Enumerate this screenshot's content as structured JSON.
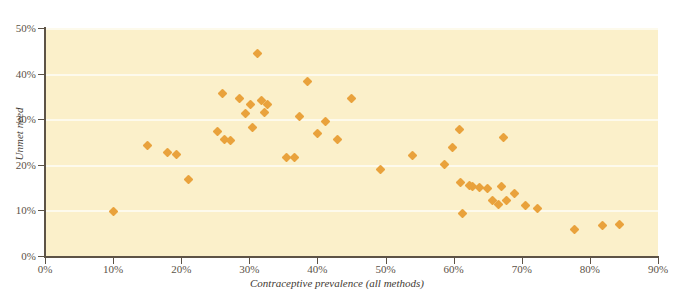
{
  "chart_data": {
    "type": "scatter",
    "title": "",
    "xlabel": "Contraceptive prevalence (all methods)",
    "ylabel": "Unmet need",
    "xlim": [
      0,
      90
    ],
    "ylim": [
      0,
      50
    ],
    "xticks": [
      "0%",
      "10%",
      "20%",
      "30%",
      "40%",
      "50%",
      "60%",
      "70%",
      "80%",
      "90%"
    ],
    "xtick_values": [
      0,
      10,
      20,
      30,
      40,
      50,
      60,
      70,
      80,
      90
    ],
    "yticks": [
      "0%",
      "10%",
      "20%",
      "30%",
      "40%",
      "50%"
    ],
    "ytick_values": [
      0,
      10,
      20,
      30,
      40,
      50
    ],
    "grid": "horizontal",
    "legend": "none",
    "marker": "diamond",
    "marker_color": "#e9a23c",
    "plot_background": "#fbf0ca",
    "gridline_color": "#fdfaec",
    "axis_color": "#5d5346",
    "points": [
      {
        "x": 10.0,
        "y": 9.8
      },
      {
        "x": 15.0,
        "y": 24.3
      },
      {
        "x": 18.0,
        "y": 22.8
      },
      {
        "x": 19.3,
        "y": 22.2
      },
      {
        "x": 21.0,
        "y": 16.7
      },
      {
        "x": 25.3,
        "y": 27.2
      },
      {
        "x": 26.0,
        "y": 35.6
      },
      {
        "x": 26.3,
        "y": 25.5
      },
      {
        "x": 27.2,
        "y": 25.4
      },
      {
        "x": 28.6,
        "y": 34.6
      },
      {
        "x": 29.5,
        "y": 31.3
      },
      {
        "x": 30.2,
        "y": 33.2
      },
      {
        "x": 30.5,
        "y": 28.2
      },
      {
        "x": 31.2,
        "y": 44.5
      },
      {
        "x": 31.8,
        "y": 34.2
      },
      {
        "x": 32.3,
        "y": 31.5
      },
      {
        "x": 32.6,
        "y": 33.3
      },
      {
        "x": 35.5,
        "y": 21.6
      },
      {
        "x": 36.6,
        "y": 21.7
      },
      {
        "x": 37.3,
        "y": 30.6
      },
      {
        "x": 38.5,
        "y": 38.3
      },
      {
        "x": 40.0,
        "y": 26.9
      },
      {
        "x": 41.2,
        "y": 29.6
      },
      {
        "x": 43.0,
        "y": 25.5
      },
      {
        "x": 45.0,
        "y": 34.5
      },
      {
        "x": 49.3,
        "y": 18.9
      },
      {
        "x": 54.0,
        "y": 22.1
      },
      {
        "x": 58.6,
        "y": 20.0
      },
      {
        "x": 59.8,
        "y": 23.8
      },
      {
        "x": 60.8,
        "y": 27.8
      },
      {
        "x": 61.0,
        "y": 16.2
      },
      {
        "x": 61.3,
        "y": 9.3
      },
      {
        "x": 62.3,
        "y": 15.5
      },
      {
        "x": 62.8,
        "y": 15.3
      },
      {
        "x": 63.8,
        "y": 15.0
      },
      {
        "x": 65.0,
        "y": 14.8
      },
      {
        "x": 65.7,
        "y": 12.2
      },
      {
        "x": 66.6,
        "y": 11.2
      },
      {
        "x": 67.0,
        "y": 15.3
      },
      {
        "x": 67.3,
        "y": 26.0
      },
      {
        "x": 67.8,
        "y": 12.1
      },
      {
        "x": 69.0,
        "y": 13.7
      },
      {
        "x": 70.6,
        "y": 11.1
      },
      {
        "x": 72.3,
        "y": 10.5
      },
      {
        "x": 77.8,
        "y": 5.8
      },
      {
        "x": 81.8,
        "y": 6.7
      },
      {
        "x": 84.3,
        "y": 6.9
      }
    ]
  }
}
